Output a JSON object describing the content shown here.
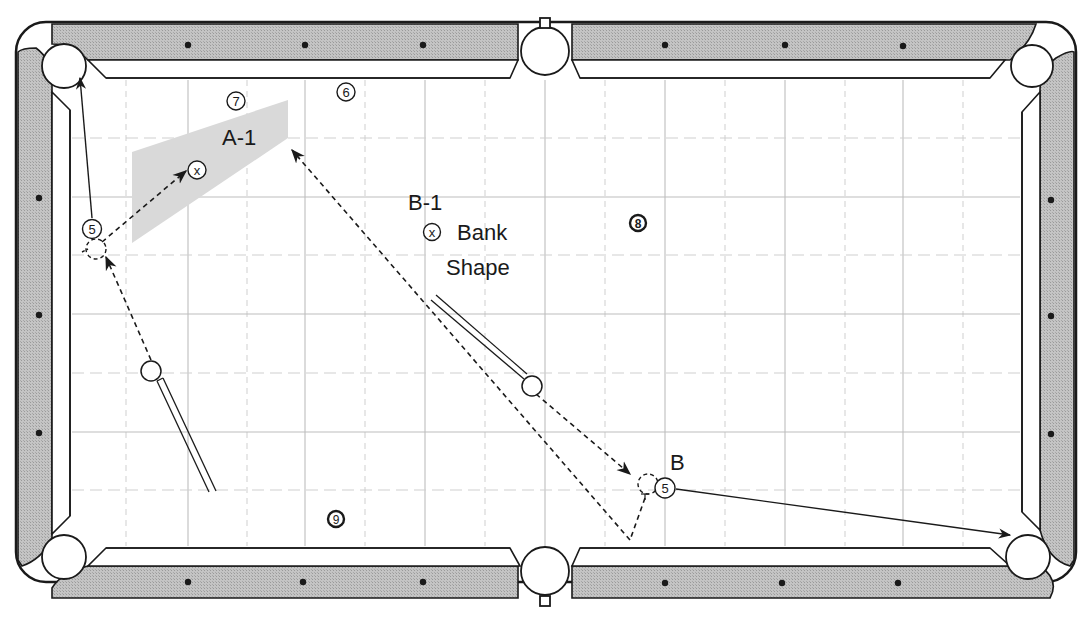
{
  "diagram": {
    "type": "pool-table-shot-diagram",
    "labels": {
      "a1": "A-1",
      "b1": "B-1",
      "bank": "Bank",
      "shape": "Shape",
      "b": "B"
    },
    "balls": {
      "ball5_a": "5",
      "ball5_b": "5",
      "ball6": "6",
      "ball7": "7",
      "ball8": "8",
      "ball9": "9",
      "target_a1": "x",
      "target_b1": "x"
    },
    "colors": {
      "rail": "#b8b8b8",
      "outline": "#1a1a1a",
      "grid_solid": "#bdbdbd",
      "grid_dashed": "#cfcfcf",
      "shaded_zone": "#d9d9d9",
      "cloth": "#ffffff"
    }
  }
}
